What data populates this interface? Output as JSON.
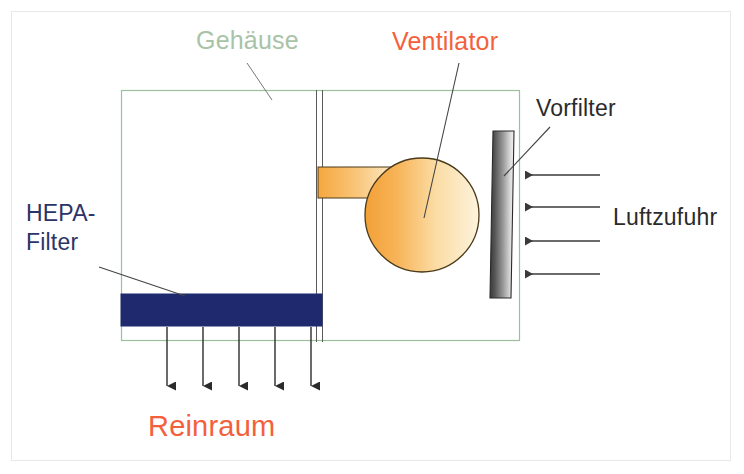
{
  "diagram": {
    "title_text": "",
    "type": "technical-cross-section",
    "background_color": "#ffffff",
    "frame_color": "#e8e8e8"
  },
  "labels": {
    "gehaeuse": "Gehäuse",
    "ventilator": "Ventilator",
    "vorfilter": "Vorfilter",
    "luftzufuhr": "Luftzufuhr",
    "hepa_line1": "HEPA-",
    "hepa_line2": "Filter",
    "reinraum": "Reinraum"
  },
  "colors": {
    "gehaeuse_label": "#a8c3a8",
    "ventilator_label": "#f4603c",
    "vorfilter_label": "#2b2b2b",
    "luftzufuhr_label": "#2b2b2b",
    "hepa_label": "#2b3468",
    "reinraum_label": "#f4603c",
    "housing_stroke": "#9cbf9c",
    "hepa_fill": "#1f2a6e",
    "fan_fill_dark": "#f5a83c",
    "fan_fill_light": "#fdf0d5",
    "fan_stroke": "#4a3a1a",
    "prefilter_dark": "#2e2e2e",
    "prefilter_light": "#f2f2f2",
    "arrow_stroke": "#3a3a3a",
    "leader_stroke": "#444444"
  },
  "shapes": {
    "housing": {
      "x": 121,
      "y": 90,
      "width": 398,
      "height": 250,
      "stroke_width": 1
    },
    "divider_line_1": {
      "x": 316,
      "y1": 90,
      "y2": 342
    },
    "divider_line_2": {
      "x": 322,
      "y1": 90,
      "y2": 342
    },
    "hepa_filter": {
      "x": 121,
      "y": 294,
      "width": 201,
      "height": 32
    },
    "fan_circle": {
      "cx": 422,
      "cy": 215,
      "r": 57
    },
    "fan_duct": {
      "x": 318,
      "y": 167,
      "width": 84,
      "height": 31
    },
    "prefilter": {
      "x_top": 493,
      "y_top": 131,
      "x_bottom": 490,
      "y_bottom": 298,
      "width": 21
    }
  },
  "arrows": {
    "intake_label": "Luftzufuhr inflow arrows",
    "intake_direction": "left",
    "intake_count": 4,
    "intake_x_start": 600,
    "intake_x_end": 523,
    "intake_ys": [
      175,
      207,
      241,
      274
    ],
    "outflow_label": "Reinraum outflow arrows",
    "outflow_direction": "down",
    "outflow_count": 5,
    "outflow_y_start": 327,
    "outflow_y_end": 388,
    "outflow_xs": [
      167,
      203,
      239,
      275,
      311
    ]
  },
  "leaders": [
    {
      "name": "gehaeuse-leader",
      "x1": 247,
      "y1": 63,
      "x2": 272,
      "y2": 100
    },
    {
      "name": "ventilator-leader",
      "x1": 459,
      "y1": 63,
      "x2": 424,
      "y2": 218
    },
    {
      "name": "vorfilter-leader",
      "x1": 548,
      "y1": 128,
      "x2": 505,
      "y2": 174
    },
    {
      "name": "hepa-leader",
      "x1": 99,
      "y1": 267,
      "x2": 184,
      "y2": 295
    }
  ]
}
